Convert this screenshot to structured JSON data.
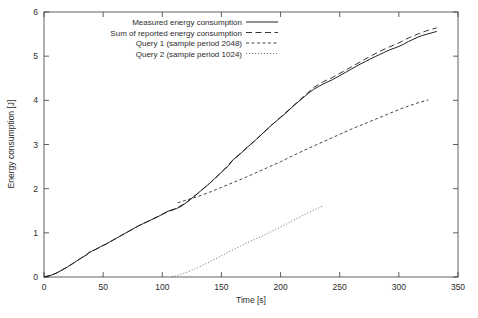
{
  "chart_data": {
    "type": "line",
    "title": "",
    "xlabel": "Time [s]",
    "ylabel": "Energy consumption [J]",
    "xlim": [
      0,
      350
    ],
    "ylim": [
      0,
      6
    ],
    "xticks": [
      0,
      50,
      100,
      150,
      200,
      250,
      300,
      350
    ],
    "yticks": [
      0,
      1,
      2,
      3,
      4,
      5,
      6
    ],
    "grid": false,
    "legend_position": "top-left-inside",
    "series": [
      {
        "name": "Measured energy consumption",
        "style": "solid",
        "points": [
          [
            0,
            0.0
          ],
          [
            4,
            0.02
          ],
          [
            8,
            0.06
          ],
          [
            12,
            0.11
          ],
          [
            16,
            0.17
          ],
          [
            20,
            0.23
          ],
          [
            24,
            0.3
          ],
          [
            28,
            0.37
          ],
          [
            32,
            0.44
          ],
          [
            36,
            0.5
          ],
          [
            38,
            0.55
          ],
          [
            40,
            0.58
          ],
          [
            44,
            0.63
          ],
          [
            48,
            0.69
          ],
          [
            52,
            0.74
          ],
          [
            56,
            0.8
          ],
          [
            60,
            0.86
          ],
          [
            64,
            0.92
          ],
          [
            68,
            0.98
          ],
          [
            72,
            1.04
          ],
          [
            76,
            1.1
          ],
          [
            80,
            1.16
          ],
          [
            84,
            1.21
          ],
          [
            88,
            1.26
          ],
          [
            92,
            1.31
          ],
          [
            96,
            1.36
          ],
          [
            100,
            1.42
          ],
          [
            104,
            1.48
          ],
          [
            108,
            1.52
          ],
          [
            112,
            1.55
          ],
          [
            116,
            1.6
          ],
          [
            120,
            1.68
          ],
          [
            124,
            1.76
          ],
          [
            128,
            1.85
          ],
          [
            132,
            1.94
          ],
          [
            136,
            2.03
          ],
          [
            140,
            2.12
          ],
          [
            144,
            2.22
          ],
          [
            148,
            2.32
          ],
          [
            152,
            2.42
          ],
          [
            156,
            2.52
          ],
          [
            160,
            2.66
          ],
          [
            164,
            2.74
          ],
          [
            168,
            2.84
          ],
          [
            172,
            2.94
          ],
          [
            176,
            3.03
          ],
          [
            180,
            3.13
          ],
          [
            184,
            3.23
          ],
          [
            188,
            3.33
          ],
          [
            192,
            3.43
          ],
          [
            196,
            3.52
          ],
          [
            200,
            3.61
          ],
          [
            204,
            3.7
          ],
          [
            208,
            3.8
          ],
          [
            212,
            3.9
          ],
          [
            216,
            3.99
          ],
          [
            220,
            4.08
          ],
          [
            224,
            4.17
          ],
          [
            228,
            4.25
          ],
          [
            232,
            4.31
          ],
          [
            236,
            4.37
          ],
          [
            240,
            4.42
          ],
          [
            244,
            4.47
          ],
          [
            248,
            4.53
          ],
          [
            252,
            4.59
          ],
          [
            256,
            4.65
          ],
          [
            260,
            4.71
          ],
          [
            264,
            4.77
          ],
          [
            268,
            4.83
          ],
          [
            272,
            4.88
          ],
          [
            276,
            4.94
          ],
          [
            280,
            4.99
          ],
          [
            284,
            5.04
          ],
          [
            288,
            5.09
          ],
          [
            292,
            5.14
          ],
          [
            296,
            5.18
          ],
          [
            300,
            5.22
          ],
          [
            304,
            5.27
          ],
          [
            308,
            5.33
          ],
          [
            312,
            5.38
          ],
          [
            316,
            5.43
          ],
          [
            320,
            5.47
          ],
          [
            324,
            5.5
          ],
          [
            328,
            5.53
          ],
          [
            332,
            5.56
          ]
        ]
      },
      {
        "name": "Sum of reported energy consumption",
        "style": "dashed-long",
        "points": [
          [
            0,
            0.0
          ],
          [
            10,
            0.08
          ],
          [
            20,
            0.23
          ],
          [
            30,
            0.4
          ],
          [
            38,
            0.55
          ],
          [
            50,
            0.71
          ],
          [
            60,
            0.86
          ],
          [
            70,
            1.01
          ],
          [
            80,
            1.16
          ],
          [
            90,
            1.29
          ],
          [
            100,
            1.42
          ],
          [
            110,
            1.53
          ],
          [
            120,
            1.68
          ],
          [
            130,
            1.89
          ],
          [
            140,
            2.12
          ],
          [
            150,
            2.37
          ],
          [
            160,
            2.66
          ],
          [
            170,
            2.89
          ],
          [
            180,
            3.13
          ],
          [
            190,
            3.38
          ],
          [
            200,
            3.62
          ],
          [
            210,
            3.86
          ],
          [
            220,
            4.1
          ],
          [
            228,
            4.29
          ],
          [
            236,
            4.42
          ],
          [
            244,
            4.52
          ],
          [
            252,
            4.64
          ],
          [
            260,
            4.76
          ],
          [
            268,
            4.88
          ],
          [
            276,
            5.0
          ],
          [
            284,
            5.11
          ],
          [
            292,
            5.21
          ],
          [
            300,
            5.3
          ],
          [
            308,
            5.41
          ],
          [
            316,
            5.5
          ],
          [
            324,
            5.58
          ],
          [
            332,
            5.64
          ]
        ]
      },
      {
        "name": "Query 1 (sample period 2048)",
        "style": "dashed-medium",
        "points": [
          [
            113,
            1.68
          ],
          [
            120,
            1.74
          ],
          [
            130,
            1.82
          ],
          [
            140,
            1.92
          ],
          [
            150,
            2.03
          ],
          [
            160,
            2.14
          ],
          [
            170,
            2.25
          ],
          [
            180,
            2.37
          ],
          [
            190,
            2.49
          ],
          [
            200,
            2.61
          ],
          [
            210,
            2.74
          ],
          [
            220,
            2.87
          ],
          [
            230,
            2.99
          ],
          [
            240,
            3.11
          ],
          [
            250,
            3.23
          ],
          [
            260,
            3.35
          ],
          [
            270,
            3.46
          ],
          [
            280,
            3.57
          ],
          [
            290,
            3.68
          ],
          [
            300,
            3.79
          ],
          [
            310,
            3.89
          ],
          [
            318,
            3.96
          ],
          [
            325,
            4.01
          ]
        ]
      },
      {
        "name": "Query 2 (sample period 1024)",
        "style": "dotted",
        "points": [
          [
            108,
            0.0
          ],
          [
            112,
            0.03
          ],
          [
            118,
            0.08
          ],
          [
            124,
            0.14
          ],
          [
            130,
            0.21
          ],
          [
            136,
            0.29
          ],
          [
            142,
            0.37
          ],
          [
            148,
            0.45
          ],
          [
            154,
            0.54
          ],
          [
            160,
            0.62
          ],
          [
            166,
            0.7
          ],
          [
            172,
            0.78
          ],
          [
            178,
            0.85
          ],
          [
            184,
            0.92
          ],
          [
            190,
            1.0
          ],
          [
            196,
            1.08
          ],
          [
            202,
            1.16
          ],
          [
            208,
            1.24
          ],
          [
            214,
            1.33
          ],
          [
            220,
            1.41
          ],
          [
            226,
            1.49
          ],
          [
            231,
            1.55
          ],
          [
            236,
            1.61
          ]
        ]
      }
    ]
  },
  "legend": {
    "entries": [
      {
        "label": "Measured energy consumption",
        "style": "solid"
      },
      {
        "label": "Sum of reported energy consumption",
        "style": "dashed-long"
      },
      {
        "label": "Query 1 (sample period 2048)",
        "style": "dashed-medium"
      },
      {
        "label": "Query 2 (sample period 1024)",
        "style": "dotted"
      }
    ]
  }
}
